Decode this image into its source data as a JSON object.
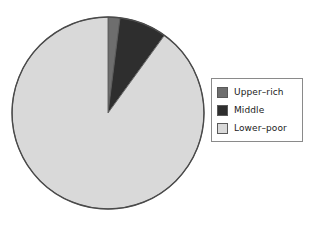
{
  "figure": {
    "background_color": "#ffffff",
    "title": ""
  },
  "pie": {
    "center_x": 98,
    "center_y": 99,
    "radius": 96,
    "outline_color": "#4a4a4a",
    "start_angle_deg": 90,
    "direction": "clockwise"
  },
  "legend": {
    "border_color": "#8a8a8a",
    "background_color": "#ffffff",
    "position": "right",
    "items": [
      {
        "label": "Upper–rich",
        "color": "#6e6e6e",
        "swatch_name": "legend-swatch-upper-rich"
      },
      {
        "label": "Middle",
        "color": "#2e2e2e",
        "swatch_name": "legend-swatch-middle"
      },
      {
        "label": "Lower–poor",
        "color": "#d9d9d9",
        "swatch_name": "legend-swatch-lower-poor"
      }
    ]
  },
  "chart_data": {
    "type": "pie",
    "title": "",
    "labels": [
      "Upper–rich",
      "Middle",
      "Lower–poor"
    ],
    "values": [
      2,
      8,
      90
    ],
    "unit": "percent",
    "colors": [
      "#6e6e6e",
      "#2e2e2e",
      "#d9d9d9"
    ],
    "legend_position": "right",
    "start_angle_deg": 90,
    "clockwise": true,
    "show_value_labels": false,
    "slices": [
      {
        "label": "Upper–rich",
        "value": 2,
        "percent": 2,
        "color": "#6e6e6e",
        "start_deg": 0,
        "end_deg": 7.2
      },
      {
        "label": "Middle",
        "value": 8,
        "percent": 8,
        "color": "#2e2e2e",
        "start_deg": 7.2,
        "end_deg": 36.0
      },
      {
        "label": "Lower–poor",
        "value": 90,
        "percent": 90,
        "color": "#d9d9d9",
        "start_deg": 36.0,
        "end_deg": 360.0
      }
    ]
  }
}
